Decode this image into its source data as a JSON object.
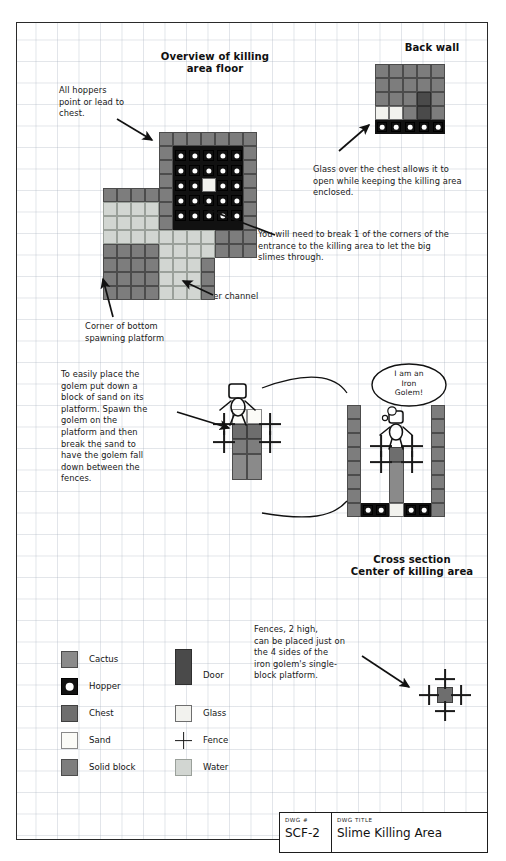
{
  "drawing": {
    "title_block": {
      "number_caption": "DWG #",
      "number_value": "SCF-2",
      "title_caption": "DWG TITLE",
      "title_value": "Slime Killing Area"
    }
  },
  "headings": {
    "overview": "Overview of killing\narea floor",
    "back_wall": "Back wall",
    "cross_section": "Cross section\nCenter of killing area"
  },
  "notes": {
    "hoppers": "All hoppers\npoint or lead to\nchest.",
    "glass": "Glass over the chest allows it to\nopen while keeping the killing area\nenclosed.",
    "break_corner": "You will need to break 1 of the corners of the\nentrance to the killing area to let the big\nslimes through.",
    "water_channel": "Water channel",
    "spawning_corner": "Corner of bottom\nspawning platform",
    "golem_sand": "To easily place the\ngolem put down a\nblock of sand on its\nplatform. Spawn the\ngolem on the\nplatform and then\nbreak the sand to\nhave the golem fall\ndown between the\nfences.",
    "fences": "Fences, 2 high,\ncan be placed just on\nthe 4 sides of the\niron golem's single-\nblock platform."
  },
  "speech_bubble": "I am an\nIron\nGolem!",
  "legend": {
    "left_column": [
      {
        "label": "Cactus",
        "swatch": "cactus"
      },
      {
        "label": "Hopper",
        "swatch": "hopper"
      },
      {
        "label": "Chest",
        "swatch": "chest"
      },
      {
        "label": "Sand",
        "swatch": "sand"
      },
      {
        "label": "Solid block",
        "swatch": "solid"
      }
    ],
    "right_column": [
      {
        "label": "Door",
        "swatch": "door"
      },
      {
        "label": "Glass",
        "swatch": "glass"
      },
      {
        "label": "Fence",
        "swatch": "fence"
      },
      {
        "label": "Water",
        "swatch": "water"
      }
    ]
  },
  "colors": {
    "solid": "#7d7d7d",
    "chest": "#6e6e6e",
    "water": "#d2d6d2",
    "sand": "#fbfbf7",
    "glass": "#f2f2ee",
    "door": "#4a4a4a",
    "cactus": "#8a8a8a",
    "hopper": "#111111",
    "ink": "#1c1c1c",
    "grid": "#a0aab9"
  },
  "diagrams": {
    "overview_floor": {
      "cell": 14,
      "origin": {
        "x": 86,
        "y": 109
      },
      "hopper_grid": {
        "cols": 5,
        "rows": 5,
        "glass_cell": {
          "col": 2,
          "row": 2
        }
      }
    },
    "back_wall": {
      "cell": 14,
      "origin": {
        "x": 374,
        "y": 62
      },
      "cols": 5,
      "rows": 5
    },
    "cross_section": {
      "cell": 13,
      "origin": {
        "x": 345,
        "y": 385
      }
    },
    "fence_detail": {
      "platform_label": "single-block platform with fences on 4 sides"
    }
  }
}
